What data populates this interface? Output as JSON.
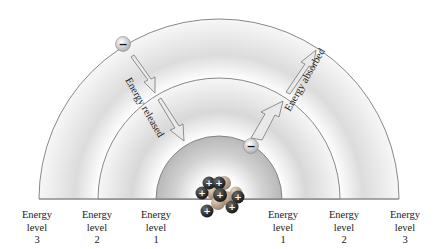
{
  "diagram": {
    "center_x": 219,
    "baseline_y": 199,
    "levels": [
      {
        "level": 1,
        "radius": 63
      },
      {
        "level": 2,
        "radius": 121
      },
      {
        "level": 3,
        "radius": 180
      }
    ],
    "arrows": {
      "released": {
        "text": "Energy released",
        "direction": "inward"
      },
      "absorbed": {
        "text": "Energy absorbed",
        "direction": "outward"
      }
    },
    "electron_symbol": "−",
    "proton_symbol": "+",
    "colors": {
      "arc_stroke": "#7a7a7a",
      "shade": "#d9d9d9",
      "electron": "#cfcfcf",
      "proton": "#2b2b2b",
      "neutron": "#b9a58f"
    }
  },
  "labels": {
    "left": [
      {
        "word1": "Energy",
        "word2": "level",
        "num": "3"
      },
      {
        "word1": "Energy",
        "word2": "level",
        "num": "2"
      },
      {
        "word1": "Energy",
        "word2": "level",
        "num": "1"
      }
    ],
    "right": [
      {
        "word1": "Energy",
        "word2": "level",
        "num": "1"
      },
      {
        "word1": "Energy",
        "word2": "level",
        "num": "2"
      },
      {
        "word1": "Energy",
        "word2": "level",
        "num": "3"
      }
    ]
  }
}
